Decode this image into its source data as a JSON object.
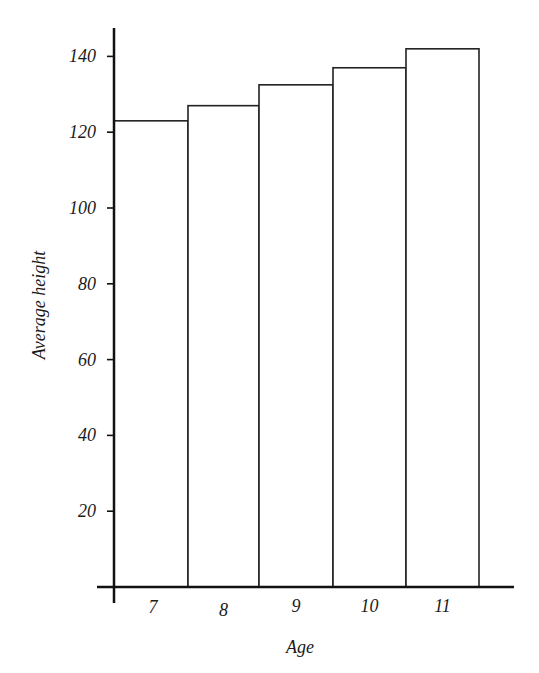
{
  "chart_data": {
    "type": "bar",
    "title": "",
    "xlabel": "Age",
    "ylabel": "Average height",
    "categories": [
      "7",
      "8",
      "9",
      "10",
      "11"
    ],
    "values": [
      123,
      127,
      132.5,
      137,
      142
    ],
    "yticks": [
      20,
      40,
      60,
      80,
      100,
      120,
      140
    ],
    "ylim": [
      0,
      150
    ],
    "grid": false,
    "legend": null,
    "bar_style": "histogram, adjacent bars, black outline, white fill"
  }
}
